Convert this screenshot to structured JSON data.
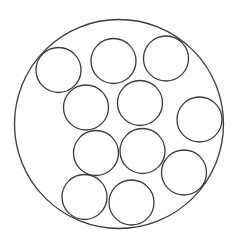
{
  "diagram": {
    "type": "circle-packing",
    "canvas": {
      "width": 232,
      "height": 237,
      "background": "#ffffff"
    },
    "stroke_color": "#3a3a3a",
    "container": {
      "cx": 119,
      "cy": 124,
      "r": 104.5
    },
    "circles": [
      {
        "cx": 58.5,
        "cy": 70,
        "r": 22.5
      },
      {
        "cx": 113.5,
        "cy": 61,
        "r": 22.5
      },
      {
        "cx": 166,
        "cy": 58.5,
        "r": 22.5
      },
      {
        "cx": 86,
        "cy": 107.5,
        "r": 22.5
      },
      {
        "cx": 140,
        "cy": 103,
        "r": 22.5
      },
      {
        "cx": 199.5,
        "cy": 119.5,
        "r": 22.5
      },
      {
        "cx": 96,
        "cy": 153,
        "r": 22.5
      },
      {
        "cx": 142.5,
        "cy": 151,
        "r": 22.5
      },
      {
        "cx": 184,
        "cy": 172.5,
        "r": 22.5
      },
      {
        "cx": 84.5,
        "cy": 197,
        "r": 22.5
      },
      {
        "cx": 131.5,
        "cy": 202.5,
        "r": 22.5
      }
    ],
    "count": 11
  }
}
